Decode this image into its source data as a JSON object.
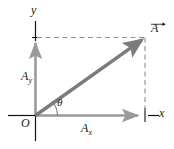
{
  "figure": {
    "axes": {
      "y_label": "y",
      "x_label": "x",
      "origin_label": "O"
    },
    "labels": {
      "angle": "θ",
      "component_y_base": "A",
      "component_y_sub": "y",
      "component_x_base": "A",
      "component_x_sub": "x",
      "vector_base": "A"
    },
    "colors": {
      "axis_black": "#111111",
      "axis_gray": "#9a9a9a",
      "vector_gray": "#7b7b7b",
      "dashed_gray": "#8d8d8d",
      "background": "#ffffff",
      "text": "#1a1a1a"
    },
    "geometry": {
      "origin_x": 35,
      "origin_y": 115,
      "vector_tip_x": 145,
      "vector_tip_y": 37,
      "x_axis_arrow_x": 141,
      "y_axis_arrow_y": 41,
      "angle_arc_radius": 22
    }
  }
}
